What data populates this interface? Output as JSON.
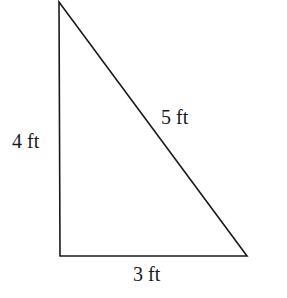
{
  "diagram": {
    "shape": "right triangle",
    "stroke_color": "#1a1a1a",
    "vertices": {
      "top": [
        59,
        2
      ],
      "bottom_left": [
        60,
        256
      ],
      "bottom_right": [
        247,
        256
      ]
    },
    "labels": {
      "left_side": "4 ft",
      "hypotenuse": "5 ft",
      "bottom_side": "3 ft"
    }
  }
}
